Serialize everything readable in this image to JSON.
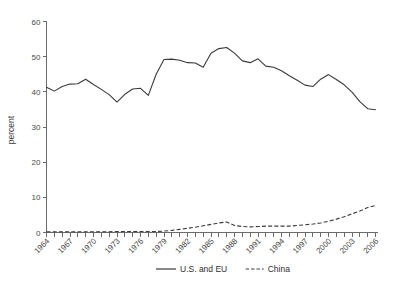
{
  "chart_data": {
    "type": "line",
    "title": "",
    "xlabel": "",
    "ylabel": "percent",
    "ylim": [
      0,
      60
    ],
    "yticks": [
      0,
      10,
      20,
      30,
      40,
      50,
      60
    ],
    "ytick_labels": [
      "0",
      "10",
      "20",
      "30",
      "40",
      "50",
      "60"
    ],
    "xlim": [
      1964,
      2006
    ],
    "xtick_labels": [
      "1964",
      "1967",
      "1970",
      "1973",
      "1976",
      "1979",
      "1982",
      "1985",
      "1988",
      "1991",
      "1994",
      "1997",
      "2000",
      "2003",
      "2006"
    ],
    "grid": false,
    "legend_position": "bottom-center",
    "x": [
      1964,
      1965,
      1966,
      1967,
      1968,
      1969,
      1970,
      1971,
      1972,
      1973,
      1974,
      1975,
      1976,
      1977,
      1978,
      1979,
      1980,
      1981,
      1982,
      1983,
      1984,
      1985,
      1986,
      1987,
      1988,
      1989,
      1990,
      1991,
      1992,
      1993,
      1994,
      1995,
      1996,
      1997,
      1998,
      1999,
      2000,
      2001,
      2002,
      2003,
      2004,
      2005,
      2006
    ],
    "series": [
      {
        "name": "U.S. and EU",
        "style": "solid",
        "color": "#3a3a3a",
        "values": [
          41.3,
          40.2,
          41.5,
          42.2,
          42.3,
          43.6,
          42.1,
          40.7,
          39.2,
          37.1,
          39.3,
          40.8,
          41.0,
          39.0,
          45.0,
          49.2,
          49.3,
          49.0,
          48.3,
          48.2,
          47.0,
          51.0,
          52.3,
          52.6,
          51.0,
          48.8,
          48.3,
          49.4,
          47.3,
          47.0,
          46.0,
          44.6,
          43.3,
          41.9,
          41.5,
          43.6,
          44.9,
          43.5,
          42.0,
          39.9,
          37.2,
          35.2,
          34.9
        ]
      },
      {
        "name": "China",
        "style": "dashed",
        "color": "#3a3a3a",
        "values": [
          0.2,
          0.2,
          0.2,
          0.2,
          0.2,
          0.2,
          0.2,
          0.2,
          0.2,
          0.3,
          0.3,
          0.3,
          0.3,
          0.3,
          0.3,
          0.4,
          0.6,
          0.9,
          1.2,
          1.5,
          1.9,
          2.3,
          2.7,
          3.0,
          2.0,
          1.7,
          1.6,
          1.7,
          1.8,
          1.8,
          1.8,
          1.8,
          2.0,
          2.2,
          2.4,
          2.7,
          3.2,
          3.8,
          4.5,
          5.3,
          6.1,
          7.1,
          7.7
        ]
      }
    ],
    "legend": [
      {
        "label": "U.S. and EU",
        "style": "solid"
      },
      {
        "label": "China",
        "style": "dashed"
      }
    ]
  }
}
